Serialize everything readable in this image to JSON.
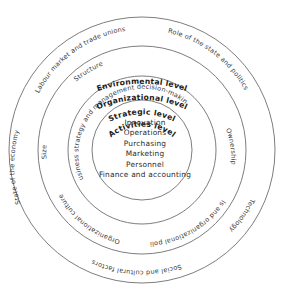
{
  "diagram": {
    "type": "concentric-rings",
    "center": {
      "x": 142,
      "y": 150
    },
    "rings": [
      {
        "key": "environmental",
        "heading": "Environmental level",
        "radius": 133,
        "factors": [
          "Labour market and trade unions",
          "Role of the state and politics",
          "Technology",
          "Social and cultural factors",
          "State of the economy"
        ]
      },
      {
        "key": "organizational",
        "heading": "Organizational level",
        "radius": 104,
        "factors": [
          "Structure",
          "Ownership",
          "Goals and organizational policies",
          "Organizational culture",
          "Size"
        ]
      },
      {
        "key": "strategic",
        "heading": "Strategic level",
        "radius": 74,
        "factors": [
          "Business strategy and management decision-making"
        ]
      },
      {
        "key": "activities",
        "heading": "Activities level",
        "radius": 50,
        "factors": []
      }
    ],
    "activities": [
      "Innovation",
      "Operations",
      "Purchasing",
      "Marketing",
      "Personnel",
      "Finance and accounting"
    ],
    "colors": {
      "stroke": "#6e6e6e",
      "heading_text": "#1a1a1a",
      "factor_text": "#3a3a3a",
      "background": "#ffffff"
    }
  }
}
